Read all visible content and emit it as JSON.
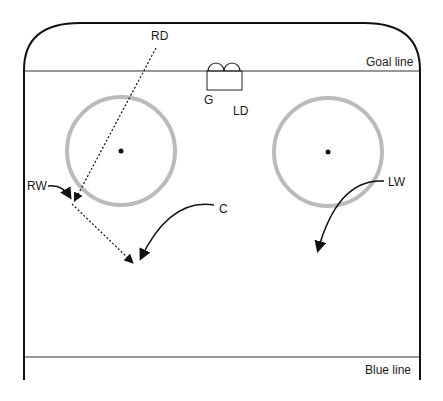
{
  "diagram": {
    "lines": {
      "goal_line": "Goal line",
      "blue_line": "Blue line"
    },
    "players": {
      "rd": "RD",
      "ld": "LD",
      "g": "G",
      "rw": "RW",
      "c": "C",
      "lw": "LW"
    },
    "colors": {
      "boards": "#111111",
      "faceoff_circle": "#bbbbbb",
      "lines": "#333333"
    }
  }
}
